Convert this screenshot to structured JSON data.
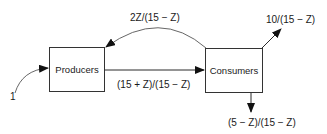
{
  "diagram": {
    "nodes": {
      "producers": "Producers",
      "consumers": "Consumers"
    },
    "flows": {
      "input": "1",
      "producers_to_consumers": "(15 + Z)/(15 − Z)",
      "consumers_to_producers": "2Z/(15 − Z)",
      "consumers_out_top": "10/(15 − Z)",
      "consumers_out_bottom": "(5 − Z)/(15 − Z)"
    }
  }
}
